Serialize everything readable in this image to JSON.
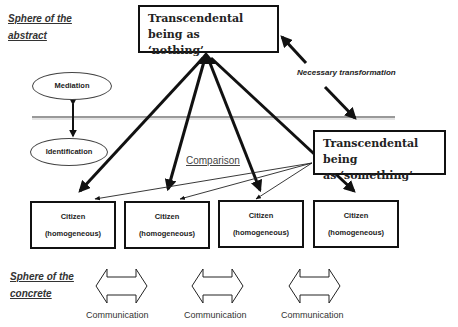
{
  "diagram": {
    "spheres": {
      "abstract": [
        "Sphere of the",
        "abstract"
      ],
      "concrete": [
        "Sphere of the",
        "concrete"
      ]
    },
    "top_box": {
      "line1": "Transcendental being as",
      "line2": "‘nothing’"
    },
    "right_box": {
      "line1": "Transcendental being",
      "line2": "as ‘something’"
    },
    "ellipses": {
      "mediation": "Mediation",
      "identification": "Identification"
    },
    "labels": {
      "necessary_transformation": "Necessary transformation",
      "comparison": "Comparison"
    },
    "citizens": [
      {
        "line1": "Citizen",
        "line2": "(homogeneous)"
      },
      {
        "line1": "Citizen",
        "line2": "(homogeneous)"
      },
      {
        "line1": "Citizen",
        "line2": "(homogeneous)"
      },
      {
        "line1": "Citizen",
        "line2": "(homogeneous)"
      }
    ],
    "communication": [
      {
        "label": "Communication"
      },
      {
        "label": "Communication"
      },
      {
        "label": "Communication"
      }
    ],
    "colors": {
      "stroke": "#111111",
      "divider": "#777777",
      "background": "#ffffff"
    }
  }
}
